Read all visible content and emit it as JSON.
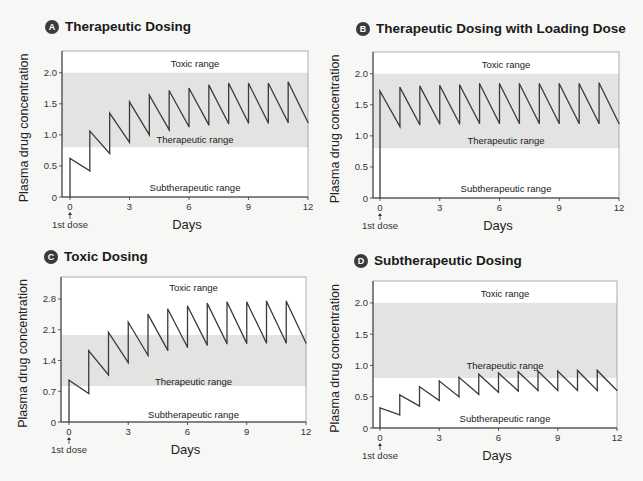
{
  "chart_data": [
    {
      "id": "A",
      "type": "line",
      "badge": "A",
      "title": "Therapeutic Dosing",
      "xlabel": "Days",
      "ylabel": "Plasma drug concentration",
      "xlim": [
        0,
        12
      ],
      "ylim": [
        0,
        2.35
      ],
      "xticks": [
        "0",
        "3",
        "6",
        "9",
        "12"
      ],
      "xtick_values": [
        0,
        3,
        6,
        9,
        12
      ],
      "yticks": [
        "0",
        "0.5",
        "1.0",
        "1.5",
        "2.0"
      ],
      "ytick_values": [
        0,
        0.5,
        1.0,
        1.5,
        2.0
      ],
      "therapeutic_band": [
        0.8,
        2.0
      ],
      "range_labels": {
        "toxic": "Toxic range",
        "therapeutic": "Therapeutic range",
        "subtherapeutic": "Subtherapeutic range"
      },
      "range_label_values": {
        "toxic": 2.15,
        "therapeutic": 0.93,
        "subtherapeutic": 0.15
      },
      "first_dose_label": "1st dose",
      "dose_interval_days": 1,
      "peaks": [
        0.62,
        1.06,
        1.35,
        1.53,
        1.64,
        1.71,
        1.75,
        1.8,
        1.83,
        1.83,
        1.83,
        1.85
      ],
      "troughs": [
        0.42,
        0.7,
        0.88,
        1.0,
        1.08,
        1.13,
        1.16,
        1.18,
        1.19,
        1.19,
        1.2,
        1.2
      ]
    },
    {
      "id": "B",
      "type": "line",
      "badge": "B",
      "title": "Therapeutic Dosing with Loading Dose",
      "xlabel": "Days",
      "ylabel": "Plasma drug concentration",
      "xlim": [
        0,
        12
      ],
      "ylim": [
        0,
        2.35
      ],
      "xticks": [
        "0",
        "3",
        "6",
        "9",
        "12"
      ],
      "xtick_values": [
        0,
        3,
        6,
        9,
        12
      ],
      "yticks": [
        "0",
        "0.5",
        "1.0",
        "1.5",
        "2.0"
      ],
      "ytick_values": [
        0,
        0.5,
        1.0,
        1.5,
        2.0
      ],
      "therapeutic_band": [
        0.8,
        2.0
      ],
      "range_labels": {
        "toxic": "Toxic range",
        "therapeutic": "Therapeutic range",
        "subtherapeutic": "Subtherapeutic range"
      },
      "range_label_values": {
        "toxic": 2.15,
        "therapeutic": 0.93,
        "subtherapeutic": 0.15
      },
      "first_dose_label": "1st dose",
      "dose_interval_days": 1,
      "peaks": [
        1.72,
        1.78,
        1.8,
        1.81,
        1.82,
        1.84,
        1.84,
        1.84,
        1.84,
        1.84,
        1.84,
        1.85
      ],
      "troughs": [
        1.15,
        1.18,
        1.19,
        1.19,
        1.2,
        1.2,
        1.2,
        1.2,
        1.2,
        1.2,
        1.2,
        1.2
      ]
    },
    {
      "id": "C",
      "type": "line",
      "badge": "C",
      "title": "Toxic Dosing",
      "xlabel": "Days",
      "ylabel": "Plasma drug concentration",
      "xlim": [
        0,
        12
      ],
      "ylim": [
        0,
        3.3
      ],
      "xticks": [
        "0",
        "3",
        "6",
        "9",
        "12"
      ],
      "xtick_values": [
        0,
        3,
        6,
        9,
        12
      ],
      "yticks": [
        "0",
        "0.7",
        "1.4",
        "2.1",
        "2.8"
      ],
      "ytick_values": [
        0,
        0.7,
        1.4,
        2.1,
        2.8
      ],
      "therapeutic_band": [
        0.82,
        1.98
      ],
      "range_labels": {
        "toxic": "Toxic range",
        "therapeutic": "Therapeutic range",
        "subtherapeutic": "Subtherapeutic range"
      },
      "range_label_values": {
        "toxic": 3.05,
        "therapeutic": 0.93,
        "subtherapeutic": 0.18
      },
      "first_dose_label": "1st dose",
      "dose_interval_days": 1,
      "peaks": [
        0.95,
        1.62,
        2.04,
        2.27,
        2.45,
        2.57,
        2.64,
        2.7,
        2.73,
        2.73,
        2.75,
        2.75
      ],
      "troughs": [
        0.65,
        1.07,
        1.35,
        1.52,
        1.63,
        1.7,
        1.75,
        1.78,
        1.79,
        1.8,
        1.8,
        1.8
      ]
    },
    {
      "id": "D",
      "type": "line",
      "badge": "D",
      "title": "Subtherapeutic Dosing",
      "xlabel": "Days",
      "ylabel": "Plasma drug concentration",
      "xlim": [
        0,
        12
      ],
      "ylim": [
        0,
        2.35
      ],
      "xticks": [
        "0",
        "3",
        "6",
        "9",
        "12"
      ],
      "xtick_values": [
        0,
        3,
        6,
        9,
        12
      ],
      "yticks": [
        "0",
        "0.5",
        "1.0",
        "1.5",
        "2.0"
      ],
      "ytick_values": [
        0,
        0.5,
        1.0,
        1.5,
        2.0
      ],
      "therapeutic_band": [
        0.8,
        2.0
      ],
      "range_labels": {
        "toxic": "Toxic range",
        "therapeutic": "Therapeutic range",
        "subtherapeutic": "Subtherapeutic range"
      },
      "range_label_values": {
        "toxic": 2.15,
        "therapeutic": 1.0,
        "subtherapeutic": 0.15
      },
      "first_dose_label": "1st dose",
      "dose_interval_days": 1,
      "peaks": [
        0.32,
        0.53,
        0.66,
        0.75,
        0.81,
        0.86,
        0.88,
        0.9,
        0.91,
        0.91,
        0.92,
        0.92
      ],
      "troughs": [
        0.21,
        0.35,
        0.44,
        0.5,
        0.54,
        0.57,
        0.59,
        0.6,
        0.6,
        0.6,
        0.6,
        0.6
      ]
    }
  ],
  "colors": {
    "band": "#e3e3e2",
    "plot_bg": "#ffffff",
    "line": "#3a3a3a",
    "badge": "#3a3a3a"
  }
}
